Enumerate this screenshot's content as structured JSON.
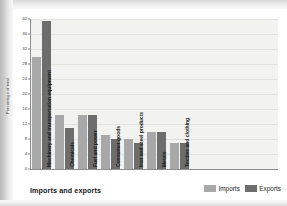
{
  "chart_data": {
    "type": "bar",
    "title": "Imports and exports",
    "xlabel": "",
    "ylabel": "Percentage of total",
    "ylim": [
      0,
      40
    ],
    "yticks": [
      0,
      4,
      8,
      12,
      16,
      20,
      24,
      28,
      32,
      36,
      40
    ],
    "grid": true,
    "legend_position": "bottom-right",
    "categories": [
      "Machinery and transportation equipment",
      "Chemicals",
      "Fuel and power",
      "Consumer goods",
      "Iron and steel products",
      "Metals",
      "Textiles and clothing"
    ],
    "series": [
      {
        "name": "Imports",
        "color": "#a8a8a8",
        "values": [
          30,
          14.5,
          14.5,
          9,
          8,
          10,
          7
        ]
      },
      {
        "name": "Exports",
        "color": "#6d6d6d",
        "values": [
          39.5,
          11,
          14.5,
          8,
          7,
          10,
          7
        ]
      }
    ]
  },
  "legend": {
    "items": [
      {
        "label": "Imports",
        "color": "#a8a8a8"
      },
      {
        "label": "Exports",
        "color": "#6d6d6d"
      }
    ]
  },
  "axis": {
    "y_title": "Percentage of total",
    "ticks": [
      "40",
      "36",
      "32",
      "28",
      "24",
      "20",
      "16",
      "12",
      "8",
      "4",
      "0"
    ]
  },
  "footer": {
    "title": "Imports and exports"
  }
}
